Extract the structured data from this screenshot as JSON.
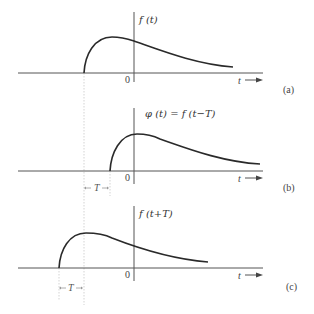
{
  "figure": {
    "panels": [
      {
        "id": "a",
        "tag": "(a)",
        "function_label": "f (t)",
        "origin_label": "0",
        "t_axis_label": "t",
        "description": "Original pulse f(t) starting before t=0"
      },
      {
        "id": "b",
        "tag": "(b)",
        "function_label": "φ (t)  =  f (t−T)",
        "origin_label": "0",
        "t_axis_label": "t",
        "shift_label": "T",
        "description": "f(t) delayed (shifted right) by T"
      },
      {
        "id": "c",
        "tag": "(c)",
        "function_label": "f (t+T)",
        "origin_label": "0",
        "t_axis_label": "t",
        "shift_label": "T",
        "description": "f(t) advanced (shifted left) by T"
      }
    ],
    "colors": {
      "curve": "#2a2a2a",
      "axis": "#555555",
      "guide": "#c8c8c8",
      "text": "#333333"
    }
  }
}
